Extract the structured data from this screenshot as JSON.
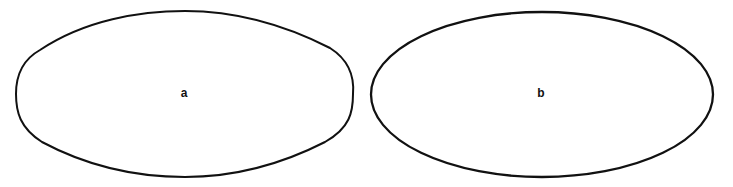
{
  "figure": {
    "shapes": [
      {
        "id": "a",
        "label": "a",
        "kind": "lemon-oval",
        "description": "Oval with slightly pointed/flattened ends"
      },
      {
        "id": "b",
        "label": "b",
        "kind": "ellipse",
        "description": "Regular ellipse"
      }
    ],
    "stroke_color": "#111111",
    "background": "#ffffff"
  }
}
